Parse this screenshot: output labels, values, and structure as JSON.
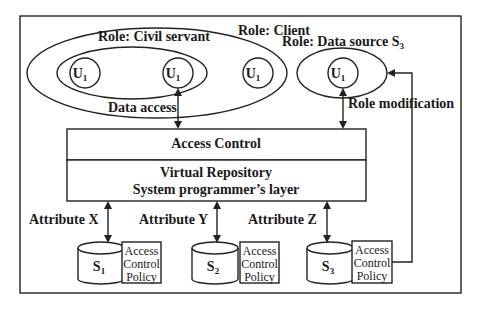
{
  "diagram": {
    "roles": {
      "civil_servant": "Role: Civil servant",
      "client": "Role: Client",
      "data_source": "Role: Data source S",
      "data_source_sub": "3"
    },
    "users": [
      {
        "label": "U",
        "sub": "1"
      },
      {
        "label": "U",
        "sub": "1"
      },
      {
        "label": "U",
        "sub": "1"
      },
      {
        "label": "U",
        "sub": "1"
      }
    ],
    "edges": {
      "data_access": "Data access",
      "role_modification": "Role modification",
      "attribute_x": "Attribute X",
      "attribute_y": "Attribute Y",
      "attribute_z": "Attribute Z"
    },
    "layers": {
      "access_control": "Access Control",
      "virtual_repository_line1": "Virtual Repository",
      "virtual_repository_line2": "System programmer’s layer"
    },
    "sources": [
      {
        "label": "S",
        "sub": "1",
        "policy": [
          "Access",
          "Control",
          "Policy"
        ]
      },
      {
        "label": "S",
        "sub": "2",
        "policy": [
          "Access",
          "Control",
          "Policy"
        ]
      },
      {
        "label": "S",
        "sub": "3",
        "policy": [
          "Access",
          "Control",
          "Policy"
        ]
      }
    ]
  }
}
